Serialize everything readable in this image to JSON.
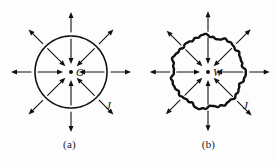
{
  "figure": {
    "background_color": "#fdfdfd",
    "ink_color": "#111111",
    "panels": [
      {
        "id": "a",
        "caption": "(a)",
        "center_label": "O",
        "field_label": "J",
        "boundary_style": "smooth-circle",
        "center": {
          "x": 71,
          "y": 72
        },
        "radius": 36,
        "arrow_count_outer": 8,
        "arrow_count_inner": 8,
        "outer_arrow_direction": "outward",
        "inner_arrow_direction": "inward"
      },
      {
        "id": "b",
        "caption": "(b)",
        "center_label": "W",
        "field_label": "J",
        "boundary_style": "jagged-closed-curve",
        "center": {
          "x": 69,
          "y": 72
        },
        "radius": 36,
        "arrow_count_outer": 8,
        "arrow_count_inner": 8,
        "outer_arrow_direction": "outward",
        "inner_arrow_direction": "inward"
      }
    ]
  }
}
